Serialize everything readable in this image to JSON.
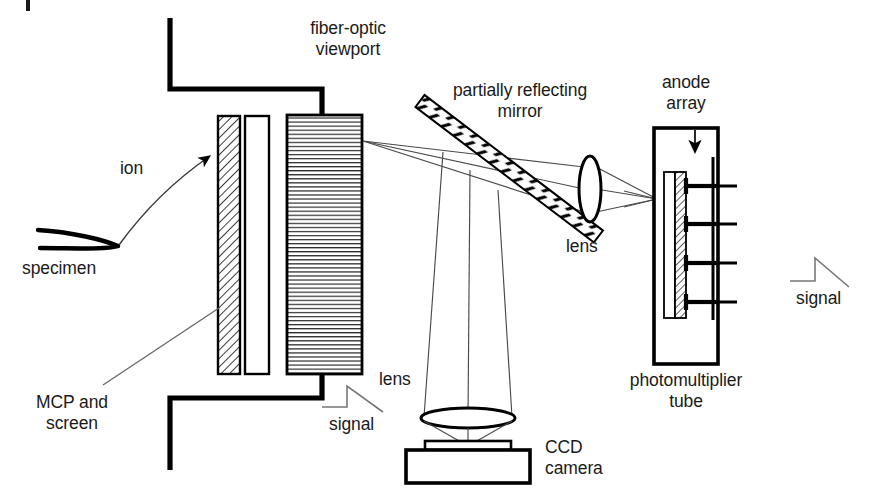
{
  "diagram": {
    "background_color": "#ffffff",
    "stroke_color": "#000000",
    "thin_stroke_color": "#555555",
    "labels": {
      "fiber_optic_viewport": "fiber-optic\nviewport",
      "ion": "ion",
      "specimen": "specimen",
      "mcp_and_screen": "MCP and\nscreen",
      "signal_left": "signal",
      "partially_reflecting_mirror": "partially reflecting\nmirror",
      "lens_pmt": "lens",
      "lens_ccd": "lens",
      "ccd_camera": "CCD\ncamera",
      "anode_array": "anode\narray",
      "photomultiplier_tube": "photomultiplier\ntube",
      "signal_right": "signal"
    },
    "components": [
      {
        "name": "specimen-tip",
        "label": "specimen",
        "kind": "needle-tip"
      },
      {
        "name": "mcp-plate",
        "label": "MCP and screen",
        "kind": "hatched-plate",
        "fill": "diagonal-hatch"
      },
      {
        "name": "phosphor-screen",
        "label": "screen",
        "kind": "plate",
        "fill": "white"
      },
      {
        "name": "fiber-optic-viewport",
        "label": "fiber-optic viewport",
        "kind": "block",
        "fill": "horizontal-lines"
      },
      {
        "name": "partially-reflecting-mirror",
        "label": "partially reflecting mirror",
        "kind": "tilted-bar",
        "fill": "dashed-hatch"
      },
      {
        "name": "collection-lens-pmt",
        "label": "lens",
        "kind": "lens-ellipse"
      },
      {
        "name": "collection-lens-ccd",
        "label": "lens",
        "kind": "lens-ellipse"
      },
      {
        "name": "ccd-camera",
        "label": "CCD camera",
        "kind": "box"
      },
      {
        "name": "photomultiplier-tube",
        "label": "photomultiplier tube",
        "kind": "box"
      },
      {
        "name": "anode-array",
        "label": "anode array",
        "kind": "hatched-plate",
        "pin_count": 4
      }
    ],
    "signal_traces": 2,
    "anode_pin_count": 4
  }
}
